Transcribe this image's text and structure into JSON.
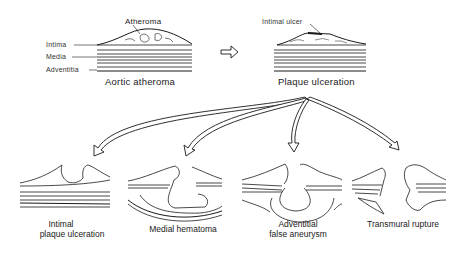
{
  "top": {
    "left_panel": {
      "caption": "Aortic atheroma",
      "labels": {
        "atheroma": "Atheroma",
        "intima": "Intima",
        "media": "Media",
        "adventitia": "Adventitia"
      }
    },
    "arrow": "right-outline-arrow",
    "right_panel": {
      "caption": "Plaque ulceration",
      "labels": {
        "intimal_ulcer": "Intimal ulcer"
      }
    }
  },
  "branches": [
    {
      "caption_line1": "Intimal",
      "caption_line2": "plaque ulceration"
    },
    {
      "caption_line1": "Medial hematoma",
      "caption_line2": ""
    },
    {
      "caption_line1": "Adventitial",
      "caption_line2": "false aneurysm"
    },
    {
      "caption_line1": "Transmural rupture",
      "caption_line2": ""
    }
  ],
  "colors": {
    "ink": "#1a1a1a",
    "background": "#ffffff"
  }
}
